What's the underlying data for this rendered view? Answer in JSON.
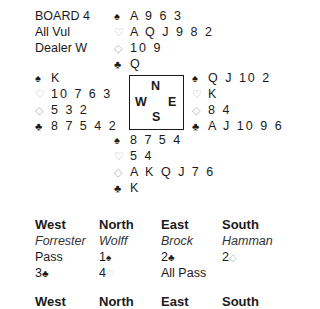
{
  "board": {
    "title": "BOARD 4",
    "vulnerability": "All Vul",
    "dealer": "Dealer W"
  },
  "suit_symbols": {
    "spades": "♠",
    "hearts": "♡",
    "diamonds": "◇",
    "clubs": "♣"
  },
  "hands": {
    "north": {
      "spades": "A 9 6 3",
      "hearts": "A Q J 9 8 2",
      "diamonds": "10 9",
      "clubs": "Q"
    },
    "west": {
      "spades": "K",
      "hearts": "10 7 6 3",
      "diamonds": "5 3 2",
      "clubs": "8 7 5 4 2"
    },
    "east": {
      "spades": "Q J 10 2",
      "hearts": "K",
      "diamonds": "8 4",
      "clubs": "A J 10 9 6 3"
    },
    "south": {
      "spades": "8 7 5 4",
      "hearts": "5 4",
      "diamonds": "A K Q J 7 6",
      "clubs": "K"
    }
  },
  "compass": {
    "n": "N",
    "s": "S",
    "e": "E",
    "w": "W"
  },
  "auction_1": {
    "headers": [
      "West",
      "North",
      "East",
      "South"
    ],
    "players": [
      "Forrester",
      "Wolff",
      "Brock",
      "Hamman"
    ],
    "rounds": [
      [
        {
          "level": "Pass",
          "suit": ""
        },
        {
          "level": "1",
          "suit": "♠"
        },
        {
          "level": "2",
          "suit": "♣"
        },
        {
          "level": "2",
          "suit": "◇"
        }
      ],
      [
        {
          "level": "3",
          "suit": "♣"
        },
        {
          "level": "4",
          "suit": "♡"
        },
        {
          "level": "All Pass",
          "suit": ""
        },
        {
          "level": "",
          "suit": ""
        }
      ]
    ]
  },
  "auction_2": {
    "headers": [
      "West",
      "North",
      "East",
      "South"
    ]
  },
  "colors": {
    "text": "#1a1a1a",
    "red_suit": "#b8b8b8"
  }
}
